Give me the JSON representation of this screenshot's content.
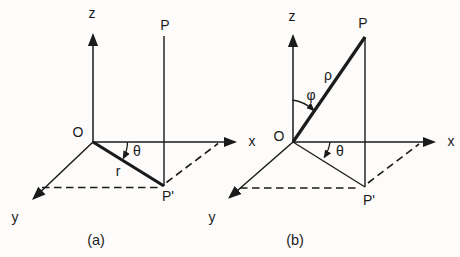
{
  "figure": {
    "bg_color": "#fdfcfa",
    "ink_color": "#1b1b1b",
    "panels": [
      {
        "caption": "(a)",
        "axis_z": "z",
        "axis_x": "x",
        "axis_y": "y",
        "origin": "O",
        "point": "P",
        "projection": "P'",
        "radial": "r",
        "azimuth": "θ"
      },
      {
        "caption": "(b)",
        "axis_z": "z",
        "axis_x": "x",
        "axis_y": "y",
        "origin": "O",
        "point": "P",
        "projection": "P'",
        "radial": "ρ",
        "polar": "φ",
        "azimuth": "θ"
      }
    ]
  }
}
